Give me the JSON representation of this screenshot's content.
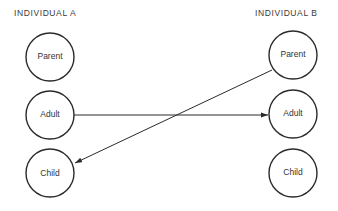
{
  "diagram": {
    "columns": [
      {
        "id": "A",
        "title": "INDIVIDUAL A",
        "nodes": [
          {
            "id": "A_parent",
            "label": "Parent"
          },
          {
            "id": "A_adult",
            "label": "Adult"
          },
          {
            "id": "A_child",
            "label": "Child"
          }
        ]
      },
      {
        "id": "B",
        "title": "INDIVIDUAL B",
        "nodes": [
          {
            "id": "B_parent",
            "label": "Parent"
          },
          {
            "id": "B_adult",
            "label": "Adult"
          },
          {
            "id": "B_child",
            "label": "Child"
          }
        ]
      }
    ],
    "edges": [
      {
        "from": "A_adult",
        "to": "B_adult",
        "direction": "A to B"
      },
      {
        "from": "B_parent",
        "to": "A_child",
        "direction": "B to A"
      }
    ],
    "colors": {
      "stroke": "#2a2a2a",
      "background": "#ffffff",
      "text": "#333333"
    }
  }
}
